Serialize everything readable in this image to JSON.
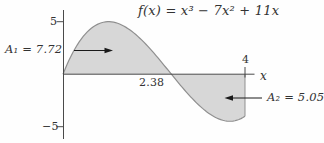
{
  "figure": {
    "title": "f(x) = x³ − 7x² + 11x",
    "x_axis_label": "x",
    "labels": {
      "area1": "A₁ = 7.72",
      "area2": "A₂ = 5.05",
      "root": "2.38",
      "ytick_top": "5",
      "ytick_bottom": "−5",
      "xtick_right": "4"
    },
    "colors": {
      "fill": "#d7d7d7",
      "curve": "#8f8f8f",
      "axis": "#4a4a4a",
      "arrow": "#1a1a1a",
      "text": "#333333"
    }
  },
  "chart_data": {
    "type": "area",
    "title": "f(x) = x³ − 7x² + 11x",
    "function": "f(x) = x^3 - 7x^2 + 11x",
    "coefficients": [
      1,
      -7,
      11,
      0
    ],
    "x_range": [
      0,
      4
    ],
    "y_range_shown": [
      -5,
      5
    ],
    "x_axis_ticks": [
      4
    ],
    "y_axis_ticks": [
      5,
      -5
    ],
    "x_intercept": 2.382,
    "x_intercept_label": "2.38",
    "areas": [
      {
        "name": "A1",
        "value": 7.72,
        "interval": [
          0,
          2.382
        ],
        "sign": "positive"
      },
      {
        "name": "A2",
        "value": 5.05,
        "interval": [
          2.382,
          4
        ],
        "sign": "negative"
      }
    ],
    "key_points": {
      "local_max": [
        1,
        5
      ],
      "local_min": [
        3.67,
        -4.48
      ],
      "f_at_4": -4
    },
    "grid": false,
    "legend": false
  }
}
